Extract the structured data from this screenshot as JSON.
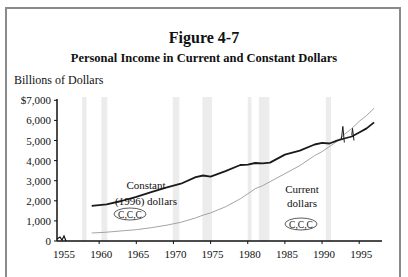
{
  "figure": {
    "title": "Figure 4-7",
    "subtitle": "Personal Income in Current and Constant Dollars",
    "ylabel": "Billions of Dollars"
  },
  "annotations": {
    "constant_label_1": "Constant",
    "constant_label_2": "(1996) dollars",
    "current_label_1": "Current",
    "current_label_2": "dollars",
    "ccc_left": "C,C,C",
    "ccc_right": "C,C,C"
  },
  "colors": {
    "constant_line": "#1a1a1a",
    "current_line": "#9a9a9a",
    "recession_band": "#ececec",
    "frame": "#8a8a8a"
  },
  "chart_data": {
    "type": "line",
    "xlabel": "",
    "ylabel": "Billions of Dollars",
    "xlim": [
      1955,
      1997
    ],
    "ylim": [
      0,
      7000
    ],
    "x_ticks": [
      "1955",
      "1960",
      "1965",
      "1970",
      "1975",
      "1980",
      "1985",
      "1990",
      "1995"
    ],
    "y_ticks": [
      "0",
      "1,000",
      "2,000",
      "3,000",
      "4,000",
      "5,000",
      "6,000",
      "$7,000"
    ],
    "grid": false,
    "legend": "inline annotations",
    "x": [
      1959,
      1961,
      1963,
      1965,
      1967,
      1969,
      1971,
      1973,
      1974,
      1975,
      1977,
      1979,
      1980,
      1981,
      1982,
      1983,
      1985,
      1987,
      1989,
      1990,
      1991,
      1992,
      1993,
      1994,
      1995,
      1996,
      1997
    ],
    "series": [
      {
        "name": "Constant (1996) dollars",
        "values": [
          1750,
          1820,
          1990,
          2200,
          2430,
          2650,
          2850,
          3180,
          3260,
          3200,
          3480,
          3780,
          3800,
          3880,
          3860,
          3900,
          4300,
          4500,
          4800,
          4880,
          4850,
          4990,
          5100,
          5200,
          5400,
          5600,
          5900
        ]
      },
      {
        "name": "Current dollars",
        "values": [
          400,
          440,
          500,
          560,
          660,
          780,
          930,
          1150,
          1290,
          1400,
          1700,
          2100,
          2350,
          2600,
          2750,
          2950,
          3350,
          3750,
          4250,
          4450,
          4700,
          4950,
          5300,
          5600,
          5950,
          6250,
          6600
        ]
      }
    ],
    "recession_bands": [
      [
        1957.7,
        1958.3
      ],
      [
        1960.3,
        1961.1
      ],
      [
        1969.9,
        1970.8
      ],
      [
        1973.9,
        1975.2
      ],
      [
        1980.0,
        1980.5
      ],
      [
        1981.5,
        1982.9
      ],
      [
        1990.5,
        1991.2
      ]
    ]
  }
}
